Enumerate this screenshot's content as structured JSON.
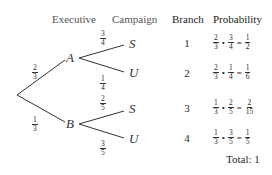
{
  "headers": {
    "executive": "Executive",
    "campaign": "Campaign",
    "branch": "Branch",
    "probability": "Probability"
  },
  "tree": {
    "level1": [
      {
        "node": "A",
        "prob": {
          "num": "2",
          "den": "3"
        }
      },
      {
        "node": "B",
        "prob": {
          "num": "1",
          "den": "3"
        }
      }
    ],
    "level2": [
      {
        "parent": "A",
        "node": "S",
        "prob": {
          "num": "3",
          "den": "4"
        }
      },
      {
        "parent": "A",
        "node": "U",
        "prob": {
          "num": "1",
          "den": "4"
        }
      },
      {
        "parent": "B",
        "node": "S",
        "prob": {
          "num": "2",
          "den": "5"
        }
      },
      {
        "parent": "B",
        "node": "U",
        "prob": {
          "num": "3",
          "den": "5"
        }
      }
    ]
  },
  "rows": [
    {
      "branch": "1",
      "a": {
        "num": "2",
        "den": "3"
      },
      "b": {
        "num": "3",
        "den": "4"
      },
      "r": {
        "num": "1",
        "den": "2"
      }
    },
    {
      "branch": "2",
      "a": {
        "num": "2",
        "den": "3"
      },
      "b": {
        "num": "1",
        "den": "4"
      },
      "r": {
        "num": "1",
        "den": "6"
      }
    },
    {
      "branch": "3",
      "a": {
        "num": "1",
        "den": "3"
      },
      "b": {
        "num": "2",
        "den": "5"
      },
      "r": {
        "num": "2",
        "den": "15"
      }
    },
    {
      "branch": "4",
      "a": {
        "num": "1",
        "den": "3"
      },
      "b": {
        "num": "3",
        "den": "5"
      },
      "r": {
        "num": "1",
        "den": "5"
      }
    }
  ],
  "symbols": {
    "times": "•",
    "equals": "="
  },
  "total": "Total: 1"
}
